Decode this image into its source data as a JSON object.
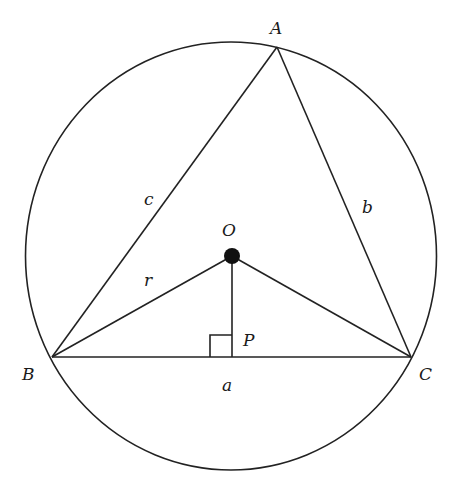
{
  "diagram": {
    "type": "geometry",
    "colors": {
      "stroke": "#222222",
      "text": "#1a1a1a",
      "background": "#ffffff"
    },
    "circle": {
      "cx": 231,
      "cy": 256,
      "rx": 205.5,
      "ry": 214
    },
    "points": {
      "A": {
        "label": "A",
        "x": 277,
        "y": 47
      },
      "B": {
        "label": "B",
        "x": 52,
        "y": 357
      },
      "C": {
        "label": "C",
        "x": 411,
        "y": 357
      },
      "O": {
        "label": "O",
        "x": 232,
        "y": 256
      },
      "P": {
        "label": "P",
        "x": 232,
        "y": 357
      }
    },
    "sides": {
      "a": {
        "label": "a",
        "between": "B-C"
      },
      "b": {
        "label": "b",
        "between": "A-C"
      },
      "c": {
        "label": "c",
        "between": "A-B"
      }
    },
    "radius_label": "r",
    "right_angle_marker": {
      "at": "P",
      "size": 22
    }
  }
}
